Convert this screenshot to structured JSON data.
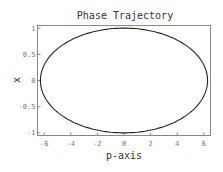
{
  "chart_data": {
    "type": "line",
    "title": "Phase Trajectory",
    "xlabel": "p-axis",
    "ylabel": "x",
    "xlim": [
      -6.5,
      6.5
    ],
    "ylim": [
      -1.05,
      1.05
    ],
    "xticks": [
      -6,
      -4,
      -2,
      0,
      2,
      4,
      6
    ],
    "yticks": [
      -1,
      -0.5,
      0,
      0.5,
      1
    ],
    "xtick_labels": [
      "-6",
      "-4",
      "-2",
      "0",
      "2",
      "4",
      "6"
    ],
    "ytick_labels": [
      "-1",
      "-0.5",
      "0",
      "0.5",
      "1"
    ],
    "grid": false,
    "legend": null,
    "series": [
      {
        "name": "trajectory",
        "shape": "ellipse",
        "p_semi_axis": 6.28,
        "x_semi_axis": 1.0,
        "center": [
          0,
          0
        ],
        "color": "#222222"
      }
    ]
  }
}
